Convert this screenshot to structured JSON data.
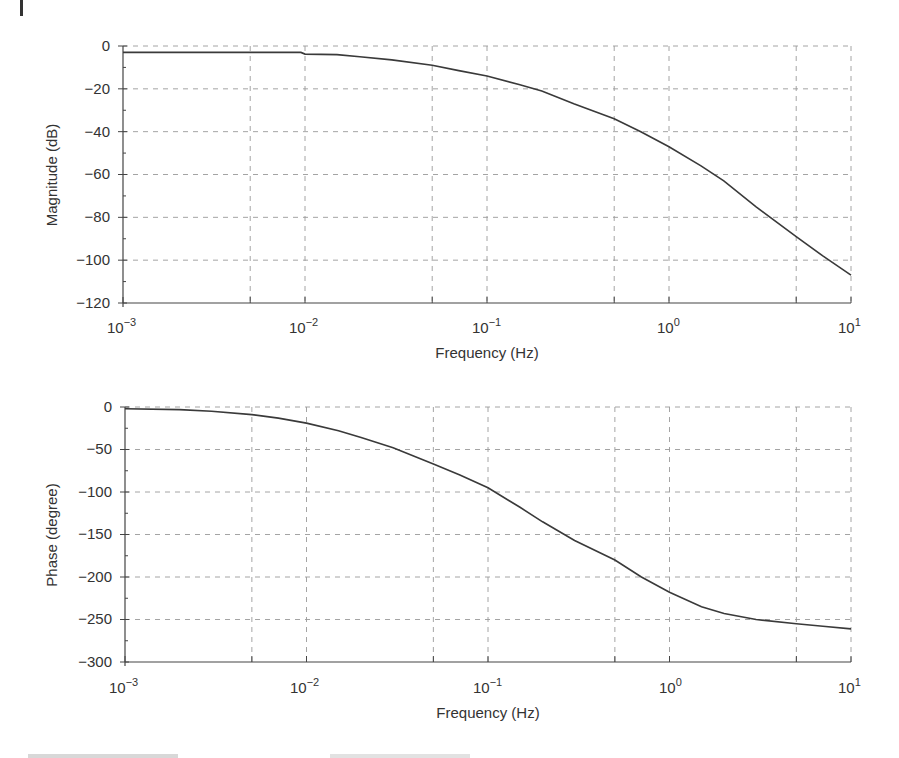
{
  "chart_data": [
    {
      "type": "line",
      "title": "",
      "xlabel": "Frequency (Hz)",
      "ylabel": "Magnitude (dB)",
      "xscale": "log",
      "xlim": [
        0.001,
        10
      ],
      "ylim": [
        -120,
        0
      ],
      "grid": true,
      "x_ticks": [
        "10^-3",
        "10^-2",
        "10^-1",
        "10^0",
        "10^1"
      ],
      "y_ticks": [
        0,
        -20,
        -40,
        -60,
        -80,
        -100,
        -120
      ],
      "series": [
        {
          "name": "Magnitude",
          "x": [
            0.001,
            0.002,
            0.005,
            0.0095,
            0.01,
            0.015,
            0.02,
            0.03,
            0.05,
            0.07,
            0.1,
            0.15,
            0.2,
            0.3,
            0.5,
            0.7,
            1,
            1.5,
            2,
            3,
            5,
            7,
            10
          ],
          "values": [
            -3,
            -3,
            -3,
            -3,
            -3.8,
            -4,
            -5,
            -6.5,
            -9,
            -11.5,
            -14,
            -18,
            -21,
            -27,
            -34,
            -40,
            -47,
            -56,
            -63,
            -75,
            -89,
            -98,
            -107
          ]
        }
      ]
    },
    {
      "type": "line",
      "title": "",
      "xlabel": "Frequency (Hz)",
      "ylabel": "Phase (degree)",
      "xscale": "log",
      "xlim": [
        0.001,
        10
      ],
      "ylim": [
        -300,
        0
      ],
      "grid": true,
      "x_ticks": [
        "10^-3",
        "10^-2",
        "10^-1",
        "10^0",
        "10^1"
      ],
      "y_ticks": [
        0,
        -50,
        -100,
        -150,
        -200,
        -250,
        -300
      ],
      "series": [
        {
          "name": "Phase",
          "x": [
            0.001,
            0.002,
            0.003,
            0.005,
            0.007,
            0.01,
            0.015,
            0.02,
            0.03,
            0.05,
            0.07,
            0.1,
            0.15,
            0.2,
            0.3,
            0.5,
            0.7,
            1,
            1.5,
            2,
            3,
            5,
            7,
            10
          ],
          "values": [
            -2,
            -3,
            -5,
            -9,
            -13,
            -19,
            -28,
            -36,
            -48,
            -67,
            -80,
            -95,
            -118,
            -135,
            -157,
            -180,
            -200,
            -218,
            -235,
            -243,
            -250,
            -255,
            -258,
            -261
          ]
        }
      ]
    }
  ],
  "plots": {
    "magnitude": {
      "ylabel": "Magnitude (dB)",
      "xlabel": "Frequency (Hz)",
      "y_tick_labels": [
        "0",
        "−20",
        "−40",
        "−60",
        "−80",
        "−100",
        "−120"
      ],
      "x_tick_bases": [
        "10",
        "10",
        "10",
        "10",
        "10"
      ],
      "x_tick_exps": [
        "−3",
        "−2",
        "−1",
        "0",
        "1"
      ]
    },
    "phase": {
      "ylabel": "Phase (degree)",
      "xlabel": "Frequency (Hz)",
      "y_tick_labels": [
        "0",
        "−50",
        "−100",
        "−150",
        "−200",
        "−250",
        "−300"
      ],
      "x_tick_bases": [
        "10",
        "10",
        "10",
        "10",
        "10"
      ],
      "x_tick_exps": [
        "−3",
        "−2",
        "−1",
        "0",
        "1"
      ]
    }
  }
}
